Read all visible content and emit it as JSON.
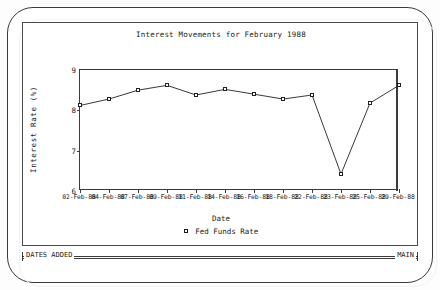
{
  "window": {
    "bezel_color": "#3a3a3a",
    "background": "#ffffff"
  },
  "statusbar": {
    "left_label": "DATES ADDED",
    "right_label": "MAIN"
  },
  "chart_data": {
    "type": "line",
    "title": "Interest Movements for February 1988",
    "xlabel": "Date",
    "ylabel": "Interest Rate (%)",
    "ylim": [
      6,
      9
    ],
    "yticks": [
      9,
      8,
      7,
      6
    ],
    "ytick_labels": [
      "9",
      "8",
      "7",
      "6"
    ],
    "grid": false,
    "legend_position": "bottom-center",
    "legend": [
      "Fed Funds Rate"
    ],
    "marker": "open-square",
    "line_color": "#222222",
    "categories": [
      "02-Feb-88",
      "04-Feb-88",
      "07-Feb-88",
      "09-Feb-88",
      "11-Feb-88",
      "14-Feb-88",
      "16-Feb-88",
      "18-Feb-88",
      "22-Feb-88",
      "23-Feb-88",
      "25-Feb-88",
      "29-Feb-88"
    ],
    "series": [
      {
        "name": "Fed Funds Rate",
        "values": [
          8.12,
          8.28,
          8.5,
          8.62,
          8.38,
          8.52,
          8.4,
          8.28,
          8.38,
          6.42,
          8.18,
          8.62
        ]
      }
    ]
  }
}
